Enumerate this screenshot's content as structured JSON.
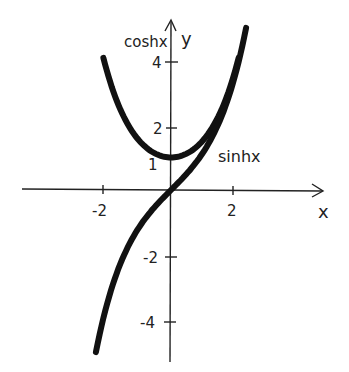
{
  "chart_data": {
    "type": "line",
    "title": "",
    "xlabel": "x",
    "ylabel": "y",
    "xlim": [
      -2.6,
      4.8
    ],
    "ylim": [
      -5.1,
      5.2
    ],
    "grid": false,
    "x_ticks": [
      -2,
      2
    ],
    "x_tick_labels": [
      "-2",
      "2"
    ],
    "y_ticks": [
      -4,
      -2,
      1,
      2,
      4
    ],
    "y_tick_labels": [
      "-4",
      "-2",
      "1",
      "2",
      "4"
    ],
    "series": [
      {
        "name": "coshx",
        "function": "cosh(x)",
        "x": [
          -2.1,
          -1.5,
          -1.0,
          -0.5,
          0,
          0.5,
          1.0,
          1.5,
          2.1
        ],
        "values": [
          4.14,
          2.35,
          1.54,
          1.13,
          1.0,
          1.13,
          1.54,
          2.35,
          4.14
        ]
      },
      {
        "name": "sinhx",
        "function": "sinh(x)",
        "x": [
          -2.3,
          -2.0,
          -1.5,
          -1.0,
          -0.5,
          0,
          0.5,
          1.0,
          1.5,
          2.0,
          2.3
        ],
        "values": [
          -4.94,
          -3.63,
          -2.13,
          -1.18,
          -0.52,
          0,
          0.52,
          1.18,
          2.13,
          3.63,
          4.94
        ]
      }
    ],
    "annotations": [
      {
        "text": "coshx",
        "near": "left branch top"
      },
      {
        "text": "sinhx",
        "near": "right of curve at y≈1"
      }
    ],
    "legend": "none"
  },
  "labels": {
    "cosh": "coshx",
    "sinh": "sinhx",
    "x_axis": "x",
    "y_axis": "y",
    "xt_neg2": "-2",
    "xt_2": "2",
    "yt_4": "4",
    "yt_2": "2",
    "yt_1": "1",
    "yt_neg2": "-2",
    "yt_neg4": "-4"
  }
}
